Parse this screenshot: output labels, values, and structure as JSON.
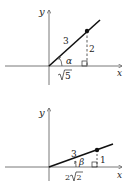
{
  "diagrams": [
    {
      "id": "top",
      "axes": {
        "x_label": "x",
        "y_label": "y"
      },
      "angle_label": "α",
      "hypotenuse_label": "3",
      "opposite_label": "2",
      "adjacent_label": "√5",
      "adjacent_radicand": "5",
      "adjacent_coefficient": ""
    },
    {
      "id": "bottom",
      "axes": {
        "x_label": "x",
        "y_label": "y"
      },
      "angle_label": "β",
      "hypotenuse_label": "3",
      "opposite_label": "1",
      "adjacent_label": "2√2",
      "adjacent_radicand": "2",
      "adjacent_coefficient": "2"
    }
  ],
  "colors": {
    "line": "#111111",
    "axis": "#555555",
    "text": "#222222"
  }
}
